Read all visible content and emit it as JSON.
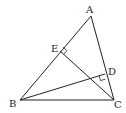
{
  "diagram": {
    "type": "geometry-triangle",
    "points": {
      "A": {
        "label": "A",
        "x": 91,
        "y": 16,
        "lx": 86,
        "ly": 13
      },
      "B": {
        "label": "B",
        "x": 20,
        "y": 100,
        "lx": 9,
        "ly": 107
      },
      "C": {
        "label": "C",
        "x": 114,
        "y": 100,
        "lx": 114,
        "ly": 108
      },
      "D": {
        "label": "D",
        "x": 105,
        "y": 74,
        "lx": 108,
        "ly": 75
      },
      "E": {
        "label": "E",
        "x": 60,
        "y": 51,
        "lx": 51,
        "ly": 52
      }
    },
    "segments": [
      {
        "name": "side-ab",
        "from": "A",
        "to": "B"
      },
      {
        "name": "side-ac",
        "from": "A",
        "to": "C"
      },
      {
        "name": "side-bc",
        "from": "B",
        "to": "C"
      },
      {
        "name": "altitude-ce",
        "from": "C",
        "to": "E"
      },
      {
        "name": "altitude-bd",
        "from": "B",
        "to": "D"
      }
    ],
    "right_angles": [
      {
        "at": "E",
        "description": "CE ⊥ AB"
      },
      {
        "at": "D",
        "description": "BD ⊥ AC"
      }
    ]
  }
}
